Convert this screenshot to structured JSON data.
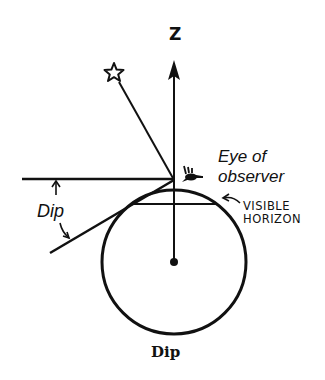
{
  "figure": {
    "caption": "Dip",
    "labels": {
      "zenith": "Z",
      "eye_line1": "Eye of",
      "eye_line2": "observer",
      "dip": "Dip",
      "horizon_line1": "VISIBLE",
      "horizon_line2": "HORIZON"
    },
    "icons": {
      "star": "star-outline",
      "eye": "eye-symbol"
    },
    "colors": {
      "ink": "#111111",
      "background": "#ffffff"
    }
  }
}
